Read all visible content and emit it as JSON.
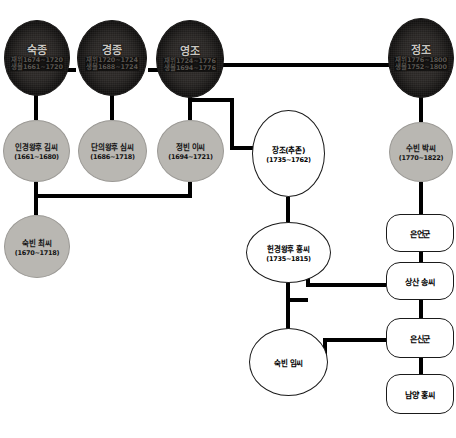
{
  "diagram": {
    "type": "genealogy-tree",
    "colors": {
      "king_fill": "#2e2b29",
      "consort_fill": "#b9b7b2",
      "plain_fill": "#ffffff",
      "line": "#000000"
    }
  },
  "nodes": {
    "sukjong": {
      "name": "숙종",
      "life": "재위1674~1720",
      "reign": "생몰1661~1720",
      "kind": "king"
    },
    "gyeongjong": {
      "name": "경종",
      "life": "재위1720~1724",
      "reign": "생몰1688~1724",
      "kind": "king"
    },
    "yeongjo": {
      "name": "영조",
      "life": "재위1724~1776",
      "reign": "생몰1694~1776",
      "kind": "king"
    },
    "jeongjo": {
      "name": "정조",
      "life": "재위1776~1800",
      "reign": "생몰1752~1800",
      "kind": "king"
    },
    "ingyeong": {
      "name": "인경왕후 김씨",
      "dates": "(1661~1680)",
      "kind": "consort"
    },
    "danui": {
      "name": "단의왕후 심씨",
      "dates": "(1686~1718)",
      "kind": "consort"
    },
    "jeongbin_lee": {
      "name": "정빈 이씨",
      "dates": "(1694~1721)",
      "kind": "consort"
    },
    "subin_park": {
      "name": "수빈 박씨",
      "dates": "(1770~1822)",
      "kind": "consort"
    },
    "sukbin_choi": {
      "name": "숙빈 최씨",
      "dates": "(1670~1718)",
      "kind": "consort"
    },
    "jangjo": {
      "name": "장조(추존)",
      "dates": "(1735~1762)",
      "kind": "plain"
    },
    "hyegyeong": {
      "name": "헌경왕후 홍씨",
      "dates": "(1735~1815)",
      "kind": "plain"
    },
    "sukbin_lim": {
      "name": "숙빈 임씨",
      "dates": "",
      "kind": "plain"
    },
    "eoneongun": {
      "name": "은언군",
      "kind": "box"
    },
    "sangsan_song": {
      "name": "상산 송씨",
      "kind": "box"
    },
    "eunsingun": {
      "name": "은신군",
      "kind": "box"
    },
    "namyang_hong": {
      "name": "남양 홍씨",
      "kind": "box"
    }
  }
}
